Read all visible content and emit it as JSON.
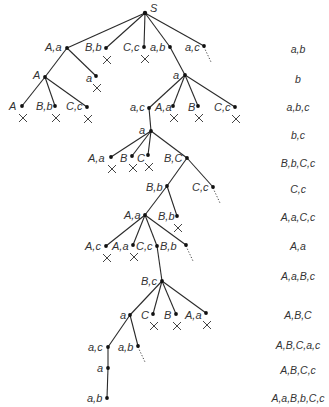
{
  "diagram": {
    "type": "search-tree",
    "root": "S",
    "nodes": [
      {
        "id": "S",
        "x": 145,
        "y": 13,
        "label": "S",
        "lx": 150,
        "ly": 2
      },
      {
        "id": "n1",
        "x": 67,
        "y": 48,
        "label": "A,a",
        "lx": 45,
        "ly": 41
      },
      {
        "id": "n2",
        "x": 106,
        "y": 48,
        "label": "B,b",
        "lx": 85,
        "ly": 41,
        "pruned": true
      },
      {
        "id": "n3",
        "x": 144,
        "y": 47,
        "label": "C,c",
        "lx": 123,
        "ly": 41,
        "pruned": true
      },
      {
        "id": "n4",
        "x": 170,
        "y": 47,
        "label": "a,b",
        "lx": 150,
        "ly": 41
      },
      {
        "id": "n5",
        "x": 204,
        "y": 46,
        "label": "a,c",
        "lx": 185,
        "ly": 41,
        "open": true
      },
      {
        "id": "n6",
        "x": 45,
        "y": 77,
        "label": "A",
        "lx": 33,
        "ly": 69
      },
      {
        "id": "n7",
        "x": 96,
        "y": 76,
        "label": "a",
        "lx": 86,
        "ly": 72,
        "pruned": true
      },
      {
        "id": "n8",
        "x": 185,
        "y": 75,
        "label": "a",
        "lx": 173,
        "ly": 69
      },
      {
        "id": "n9",
        "x": 22,
        "y": 106,
        "label": "A",
        "lx": 9,
        "ly": 100,
        "pruned": true
      },
      {
        "id": "n10",
        "x": 55,
        "y": 106,
        "label": "B,b",
        "lx": 36,
        "ly": 100,
        "pruned": true
      },
      {
        "id": "n11",
        "x": 87,
        "y": 107,
        "label": "C,c",
        "lx": 66,
        "ly": 100,
        "pruned": true
      },
      {
        "id": "n12",
        "x": 149,
        "y": 108,
        "label": "a,c",
        "lx": 130,
        "ly": 101
      },
      {
        "id": "n13",
        "x": 173,
        "y": 106,
        "label": "A,a",
        "lx": 155,
        "ly": 101,
        "pruned": true
      },
      {
        "id": "n14",
        "x": 198,
        "y": 106,
        "label": "B",
        "lx": 188,
        "ly": 101,
        "pruned": true
      },
      {
        "id": "n15",
        "x": 235,
        "y": 107,
        "label": "C,c",
        "lx": 214,
        "ly": 101,
        "pruned": true
      },
      {
        "id": "n16",
        "x": 151,
        "y": 131,
        "label": "a",
        "lx": 139,
        "ly": 124
      },
      {
        "id": "n17",
        "x": 111,
        "y": 157,
        "label": "A,a",
        "lx": 88,
        "ly": 152,
        "pruned": true
      },
      {
        "id": "n18",
        "x": 132,
        "y": 156,
        "label": "B",
        "lx": 120,
        "ly": 152,
        "pruned": true
      },
      {
        "id": "n19",
        "x": 148,
        "y": 155,
        "label": "C",
        "lx": 137,
        "ly": 152,
        "pruned": true
      },
      {
        "id": "n20",
        "x": 187,
        "y": 158,
        "label": "B,C",
        "lx": 164,
        "ly": 152
      },
      {
        "id": "n21",
        "x": 167,
        "y": 186,
        "label": "B,b",
        "lx": 146,
        "ly": 181
      },
      {
        "id": "n22",
        "x": 213,
        "y": 187,
        "label": "C,c",
        "lx": 192,
        "ly": 181,
        "open": true
      },
      {
        "id": "n23",
        "x": 145,
        "y": 215,
        "label": "A,a",
        "lx": 124,
        "ly": 209
      },
      {
        "id": "n24",
        "x": 177,
        "y": 216,
        "label": "B,b",
        "lx": 158,
        "ly": 210,
        "pruned": true
      },
      {
        "id": "n25",
        "x": 106,
        "y": 246,
        "label": "A,c",
        "lx": 85,
        "ly": 240,
        "pruned": true
      },
      {
        "id": "n26",
        "x": 133,
        "y": 245,
        "label": "A,a",
        "lx": 112,
        "ly": 240,
        "pruned": true
      },
      {
        "id": "n27",
        "x": 157,
        "y": 246,
        "label": "C,c",
        "lx": 136,
        "ly": 240
      },
      {
        "id": "n28",
        "x": 186,
        "y": 245,
        "label": "B,b",
        "lx": 160,
        "ly": 240,
        "open": true
      },
      {
        "id": "n29",
        "x": 162,
        "y": 281,
        "label": "B,c",
        "lx": 141,
        "ly": 275
      },
      {
        "id": "n30",
        "x": 130,
        "y": 315,
        "label": "a",
        "lx": 120,
        "ly": 309
      },
      {
        "id": "n31",
        "x": 153,
        "y": 314,
        "label": "C",
        "lx": 141,
        "ly": 309,
        "pruned": true
      },
      {
        "id": "n32",
        "x": 176,
        "y": 314,
        "label": "B",
        "lx": 164,
        "ly": 309,
        "pruned": true
      },
      {
        "id": "n33",
        "x": 206,
        "y": 313,
        "label": "A,a",
        "lx": 185,
        "ly": 309,
        "pruned": true
      },
      {
        "id": "n34",
        "x": 108,
        "y": 347,
        "label": "a,c",
        "lx": 88,
        "ly": 341
      },
      {
        "id": "n35",
        "x": 138,
        "y": 346,
        "label": "a,b",
        "lx": 118,
        "ly": 341,
        "open": true
      },
      {
        "id": "n36",
        "x": 108,
        "y": 368,
        "label": "a",
        "lx": 97,
        "ly": 362
      },
      {
        "id": "n37",
        "x": 107,
        "y": 398,
        "label": "a,b",
        "lx": 87,
        "ly": 392
      }
    ],
    "edges": [
      [
        "S",
        "n1"
      ],
      [
        "S",
        "n2"
      ],
      [
        "S",
        "n3"
      ],
      [
        "S",
        "n4"
      ],
      [
        "S",
        "n5"
      ],
      [
        "n1",
        "n6"
      ],
      [
        "n1",
        "n7"
      ],
      [
        "n4",
        "n8"
      ],
      [
        "n6",
        "n9"
      ],
      [
        "n6",
        "n10"
      ],
      [
        "n6",
        "n11"
      ],
      [
        "n8",
        "n12"
      ],
      [
        "n8",
        "n13"
      ],
      [
        "n8",
        "n14"
      ],
      [
        "n8",
        "n15"
      ],
      [
        "n12",
        "n16"
      ],
      [
        "n16",
        "n17"
      ],
      [
        "n16",
        "n18"
      ],
      [
        "n16",
        "n19"
      ],
      [
        "n16",
        "n20"
      ],
      [
        "n20",
        "n21"
      ],
      [
        "n20",
        "n22"
      ],
      [
        "n21",
        "n23"
      ],
      [
        "n21",
        "n24"
      ],
      [
        "n23",
        "n25"
      ],
      [
        "n23",
        "n26"
      ],
      [
        "n23",
        "n27"
      ],
      [
        "n23",
        "n28"
      ],
      [
        "n27",
        "n29"
      ],
      [
        "n29",
        "n30"
      ],
      [
        "n29",
        "n31"
      ],
      [
        "n29",
        "n32"
      ],
      [
        "n29",
        "n33"
      ],
      [
        "n30",
        "n34"
      ],
      [
        "n30",
        "n35"
      ],
      [
        "n34",
        "n36"
      ],
      [
        "n36",
        "n37"
      ]
    ],
    "pruned_marker": "×",
    "side_labels": [
      {
        "y": 43,
        "text": "a,b"
      },
      {
        "y": 73,
        "text": "b"
      },
      {
        "y": 101,
        "text": "a,b,c"
      },
      {
        "y": 129,
        "text": "b,c"
      },
      {
        "y": 157,
        "text": "B,b,C,c"
      },
      {
        "y": 183,
        "text": "C,c"
      },
      {
        "y": 211,
        "text": "A,a,C,c"
      },
      {
        "y": 240,
        "text": "A,a"
      },
      {
        "y": 270,
        "text": "A,a,B,c"
      },
      {
        "y": 309,
        "text": "A,B,C"
      },
      {
        "y": 339,
        "text": "A,B,C,a,c"
      },
      {
        "y": 364,
        "text": "A,B,C,c"
      },
      {
        "y": 392,
        "text": "A,a,B,b,C,c"
      }
    ],
    "side_label_x": 298
  }
}
